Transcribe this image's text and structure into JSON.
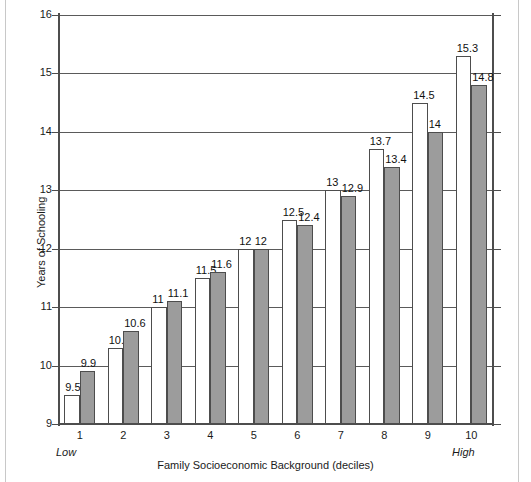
{
  "chart_data": {
    "type": "bar",
    "title": "",
    "xlabel": "Family Socioeconomic Background (deciles)",
    "ylabel": "Years of Schooling",
    "categories": [
      "1",
      "2",
      "3",
      "4",
      "5",
      "6",
      "7",
      "8",
      "9",
      "10"
    ],
    "x_axis_endpoint_labels": {
      "left": "Low",
      "right": "High"
    },
    "ylim": [
      9,
      16
    ],
    "y_ticks": [
      9,
      10,
      11,
      12,
      13,
      14,
      15,
      16
    ],
    "grid": true,
    "legend": "none",
    "series": [
      {
        "name": "open-bar-series",
        "style": "white-outlined",
        "color": "#ffffff",
        "values": [
          9.5,
          10.3,
          11,
          11.5,
          12,
          12.5,
          13,
          13.7,
          14.5,
          15.3
        ],
        "labels": [
          "9.5",
          "10.3",
          "11",
          "11.5",
          "12",
          "12.5",
          "13",
          "13.7",
          "14.5",
          "15.3"
        ]
      },
      {
        "name": "filled-bar-series",
        "style": "gray-filled",
        "color": "#9c9c9c",
        "values": [
          9.9,
          10.6,
          11.1,
          11.6,
          12,
          12.4,
          12.9,
          13.4,
          14,
          14.8
        ],
        "labels": [
          "9.9",
          "10.6",
          "11.1",
          "11.6",
          "12",
          "12.4",
          "12.9",
          "13.4",
          "14",
          "14.8"
        ]
      }
    ]
  },
  "axis": {
    "y_tick_labels": [
      "16",
      "15",
      "14",
      "13",
      "12",
      "11",
      "10",
      "9"
    ],
    "x_tick_labels": [
      "1",
      "2",
      "3",
      "4",
      "5",
      "6",
      "7",
      "8",
      "9",
      "10"
    ],
    "y_title": "Years of Schooling",
    "x_title": "Family Socioeconomic Background (deciles)",
    "low_label": "Low",
    "high_label": "High"
  },
  "colors": {
    "bar_fill_gray": "#9c9c9c",
    "bar_outline": "#4d4d4d",
    "gridline": "#5a5a5a",
    "text": "#1a1a1a",
    "background": "#ffffff"
  }
}
